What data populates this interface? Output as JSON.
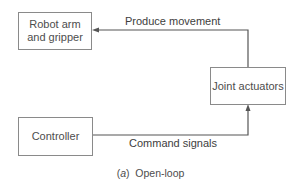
{
  "diagram": {
    "title": "Open-loop",
    "caption": {
      "prefix": "(a)",
      "text": "Open-loop"
    },
    "nodes": [
      {
        "id": "robot",
        "label_line1": "Robot arm",
        "label_line2": "and gripper"
      },
      {
        "id": "actuators",
        "label": "Joint actuators"
      },
      {
        "id": "controller",
        "label": "Controller"
      }
    ],
    "edges": [
      {
        "from": "controller",
        "to": "actuators",
        "label": "Command signals"
      },
      {
        "from": "actuators",
        "to": "robot",
        "label": "Produce movement"
      }
    ],
    "colors": {
      "line": "#555555",
      "box_border": "#8a8a8a",
      "text": "#4a4a4a"
    }
  }
}
